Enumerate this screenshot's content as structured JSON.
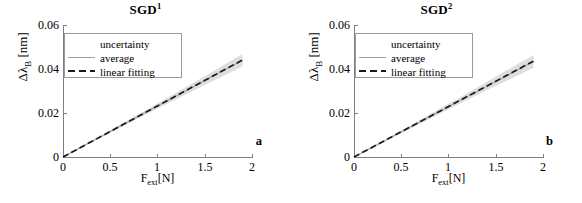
{
  "figure": {
    "background": "#ffffff",
    "panel_count": 2
  },
  "chart_data": [
    {
      "type": "line",
      "title": "SGD",
      "title_superscript": "1",
      "panel_letter": "a",
      "xlabel": "F",
      "xlabel_sub": "ext",
      "xlabel_unit": "[N]",
      "ylabel": "Δλ",
      "ylabel_sub": "B",
      "ylabel_unit": "[nm]",
      "xlim": [
        0,
        2
      ],
      "ylim": [
        0,
        0.06
      ],
      "xticks": [
        0,
        0.5,
        1,
        1.5,
        2
      ],
      "xticklabels": [
        "0",
        "0.5",
        "1",
        "1.5",
        "2"
      ],
      "yticks": [
        0,
        0.02,
        0.04,
        0.06
      ],
      "yticklabels": [
        "0",
        "0.02",
        "0.04",
        "0.06"
      ],
      "grid": false,
      "legend_position": "upper-left",
      "legend": [
        {
          "label": "uncertainty",
          "style": "patch",
          "color": "#dedede"
        },
        {
          "label": "average",
          "style": "solid-line",
          "color": "#a0a0a0"
        },
        {
          "label": "linear fitting",
          "style": "dashed-line",
          "color": "#1a1a1a"
        }
      ],
      "series": [
        {
          "name": "average",
          "style": "solid-line",
          "color": "#a0a0a0",
          "x": [
            0,
            0.19,
            0.38,
            0.57,
            0.76,
            0.95,
            1.14,
            1.33,
            1.52,
            1.71,
            1.9
          ],
          "values": [
            0.0,
            0.0044,
            0.0088,
            0.0132,
            0.0176,
            0.022,
            0.0264,
            0.0308,
            0.0352,
            0.0396,
            0.044
          ]
        },
        {
          "name": "linear fitting",
          "style": "dashed-line",
          "color": "#1a1a1a",
          "x": [
            0,
            1.9
          ],
          "values": [
            0.0,
            0.0441
          ],
          "slope": 0.0232,
          "intercept": 0.0
        },
        {
          "name": "uncertainty",
          "style": "band",
          "color": "#dedede",
          "x": [
            0,
            0.19,
            0.38,
            0.57,
            0.76,
            0.95,
            1.14,
            1.33,
            1.52,
            1.71,
            1.9
          ],
          "upper": [
            0.0002,
            0.0047,
            0.0093,
            0.0139,
            0.0185,
            0.0231,
            0.0278,
            0.0325,
            0.0372,
            0.042,
            0.0468
          ],
          "lower": [
            -0.0002,
            0.0041,
            0.0083,
            0.0125,
            0.0167,
            0.0209,
            0.025,
            0.0291,
            0.0332,
            0.0372,
            0.0412
          ]
        }
      ]
    },
    {
      "type": "line",
      "title": "SGD",
      "title_superscript": "2",
      "panel_letter": "b",
      "xlabel": "F",
      "xlabel_sub": "ext",
      "xlabel_unit": "[N]",
      "ylabel": "Δλ",
      "ylabel_sub": "B",
      "ylabel_unit": "[nm]",
      "xlim": [
        0,
        2
      ],
      "ylim": [
        0,
        0.06
      ],
      "xticks": [
        0,
        0.5,
        1,
        1.5,
        2
      ],
      "xticklabels": [
        "0",
        "0.5",
        "1",
        "1.5",
        "2"
      ],
      "yticks": [
        0,
        0.02,
        0.04,
        0.06
      ],
      "yticklabels": [
        "0",
        "0.02",
        "0.04",
        "0.06"
      ],
      "grid": false,
      "legend_position": "upper-left",
      "legend": [
        {
          "label": "uncertainty",
          "style": "patch",
          "color": "#dedede"
        },
        {
          "label": "average",
          "style": "solid-line",
          "color": "#a0a0a0"
        },
        {
          "label": "linear fitting",
          "style": "dashed-line",
          "color": "#1a1a1a"
        }
      ],
      "series": [
        {
          "name": "average",
          "style": "solid-line",
          "color": "#a0a0a0",
          "x": [
            0,
            0.19,
            0.38,
            0.57,
            0.76,
            0.95,
            1.14,
            1.33,
            1.52,
            1.71,
            1.9
          ],
          "values": [
            0.0,
            0.0043,
            0.0087,
            0.013,
            0.0174,
            0.0217,
            0.0261,
            0.0304,
            0.0348,
            0.0391,
            0.0435
          ]
        },
        {
          "name": "linear fitting",
          "style": "dashed-line",
          "color": "#1a1a1a",
          "x": [
            0,
            1.9
          ],
          "values": [
            0.0,
            0.0436
          ],
          "slope": 0.0229,
          "intercept": 0.0
        },
        {
          "name": "uncertainty",
          "style": "band",
          "color": "#dedede",
          "x": [
            0,
            0.19,
            0.38,
            0.57,
            0.76,
            0.95,
            1.14,
            1.33,
            1.52,
            1.71,
            1.9
          ],
          "upper": [
            0.0002,
            0.0046,
            0.0092,
            0.0138,
            0.0184,
            0.023,
            0.0276,
            0.0323,
            0.037,
            0.0417,
            0.0464
          ],
          "lower": [
            -0.0002,
            0.004,
            0.0082,
            0.0123,
            0.0165,
            0.0206,
            0.0247,
            0.0287,
            0.0327,
            0.0366,
            0.0406
          ]
        }
      ]
    }
  ]
}
